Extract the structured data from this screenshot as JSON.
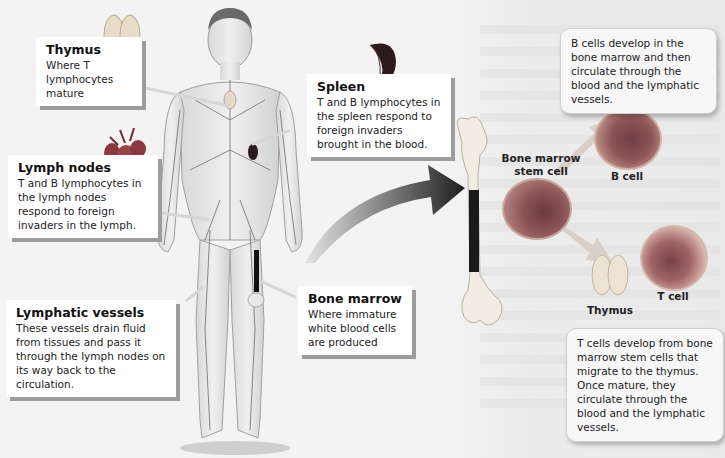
{
  "callouts": {
    "thymus": {
      "title": "Thymus",
      "text": "Where T lymphocytes mature"
    },
    "lymph_nodes": {
      "title": "Lymph nodes",
      "text": "T and B lymphocytes in the lymph nodes respond to foreign invaders in the lymph."
    },
    "lymphatic_vessels": {
      "title": "Lymphatic vessels",
      "text": "These vessels drain fluid from tissues and pass it through the lymph nodes on its way back to the circulation."
    },
    "spleen": {
      "title": "Spleen",
      "text": "T and B lymphocytes in the spleen respond to foreign invaders brought in the blood."
    },
    "bone_marrow": {
      "title": "Bone marrow",
      "text": "Where immature white blood cells are produced"
    }
  },
  "info_boxes": {
    "b_cells": "B cells develop in the bone marrow and then circulate through the blood and the lymphatic vessels.",
    "t_cells": "T cells develop from bone marrow stem cells that migrate to the thymus. Once mature, they circulate through the blood and the lymphatic vessels."
  },
  "labels": {
    "stem_cell": "Bone marrow stem cell",
    "b_cell": "B cell",
    "t_cell": "T cell",
    "thymus": "Thymus"
  },
  "colors": {
    "background": "#f3f3f3",
    "callout_bg": "#ffffff",
    "callout_shadow": "#9c9c9c",
    "arrow_dark": "#2a2a2a",
    "spleen": "#3a1e22",
    "cell_nucleus": "#6f3e44"
  }
}
